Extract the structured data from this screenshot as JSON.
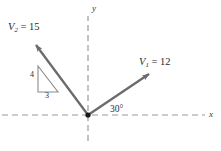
{
  "figure": {
    "type": "vector-diagram",
    "background_color": "#ffffff",
    "axes": {
      "x_label": "x",
      "y_label": "y",
      "style": "dashed",
      "color": "#9a9a9a",
      "origin": {
        "x": 88,
        "y": 115
      },
      "x_extent": [
        2,
        205
      ],
      "y_extent": [
        16,
        141
      ]
    },
    "origin_dot": {
      "color": "#1a1a1a",
      "radius": 2.6
    },
    "vectors": [
      {
        "id": "v1",
        "label": "V",
        "subscript": "1",
        "equals": "= 12",
        "magnitude": 12,
        "label_text": "V1 = 12",
        "angle_deg": 30,
        "direction": "up-right",
        "color": "#6b6b6b",
        "start": {
          "x": 88,
          "y": 115
        },
        "end": {
          "x": 152,
          "y": 72
        }
      },
      {
        "id": "v2",
        "label": "V",
        "subscript": "2",
        "equals": "= 15",
        "magnitude": 15,
        "label_text": "V2 = 15",
        "direction": "up-left",
        "slope_run": 3,
        "slope_rise": 4,
        "color": "#6b6b6b",
        "start": {
          "x": 88,
          "y": 115
        },
        "end": {
          "x": 33,
          "y": 41
        }
      }
    ],
    "angle_annotation": {
      "text": "30°",
      "value": 30,
      "unit": "degrees",
      "between": [
        "x-axis",
        "v1"
      ]
    },
    "slope_triangle": {
      "vertical_leg_label": "4",
      "horizontal_leg_label": "3",
      "color": "#8a8a8a",
      "right_angle_corner": {
        "x": 38,
        "y": 92
      },
      "top_corner": {
        "x": 38,
        "y": 66
      },
      "bottom_right_corner": {
        "x": 58,
        "y": 92
      }
    }
  }
}
